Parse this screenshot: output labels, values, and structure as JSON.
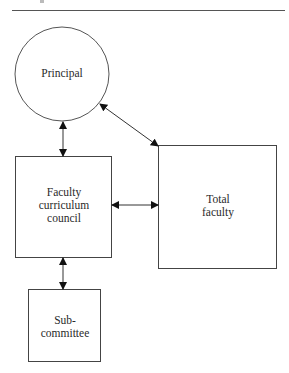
{
  "diagram": {
    "type": "organizational-flow",
    "nodes": [
      {
        "id": "principal",
        "shape": "circle",
        "label": "Principal"
      },
      {
        "id": "council",
        "shape": "rectangle",
        "label_lines": [
          "Faculty",
          "curriculum",
          "council"
        ]
      },
      {
        "id": "total_faculty",
        "shape": "rectangle",
        "label_lines": [
          "Total",
          "faculty"
        ]
      },
      {
        "id": "subcommittee",
        "shape": "rectangle",
        "label_lines": [
          "Sub-",
          "committee"
        ]
      }
    ],
    "edges": [
      {
        "from": "principal",
        "to": "council",
        "direction": "both"
      },
      {
        "from": "principal",
        "to": "total_faculty",
        "direction": "both"
      },
      {
        "from": "council",
        "to": "total_faculty",
        "direction": "both"
      },
      {
        "from": "council",
        "to": "subcommittee",
        "direction": "both"
      }
    ],
    "colors": {
      "stroke": "#444444",
      "background": "#ffffff"
    }
  }
}
